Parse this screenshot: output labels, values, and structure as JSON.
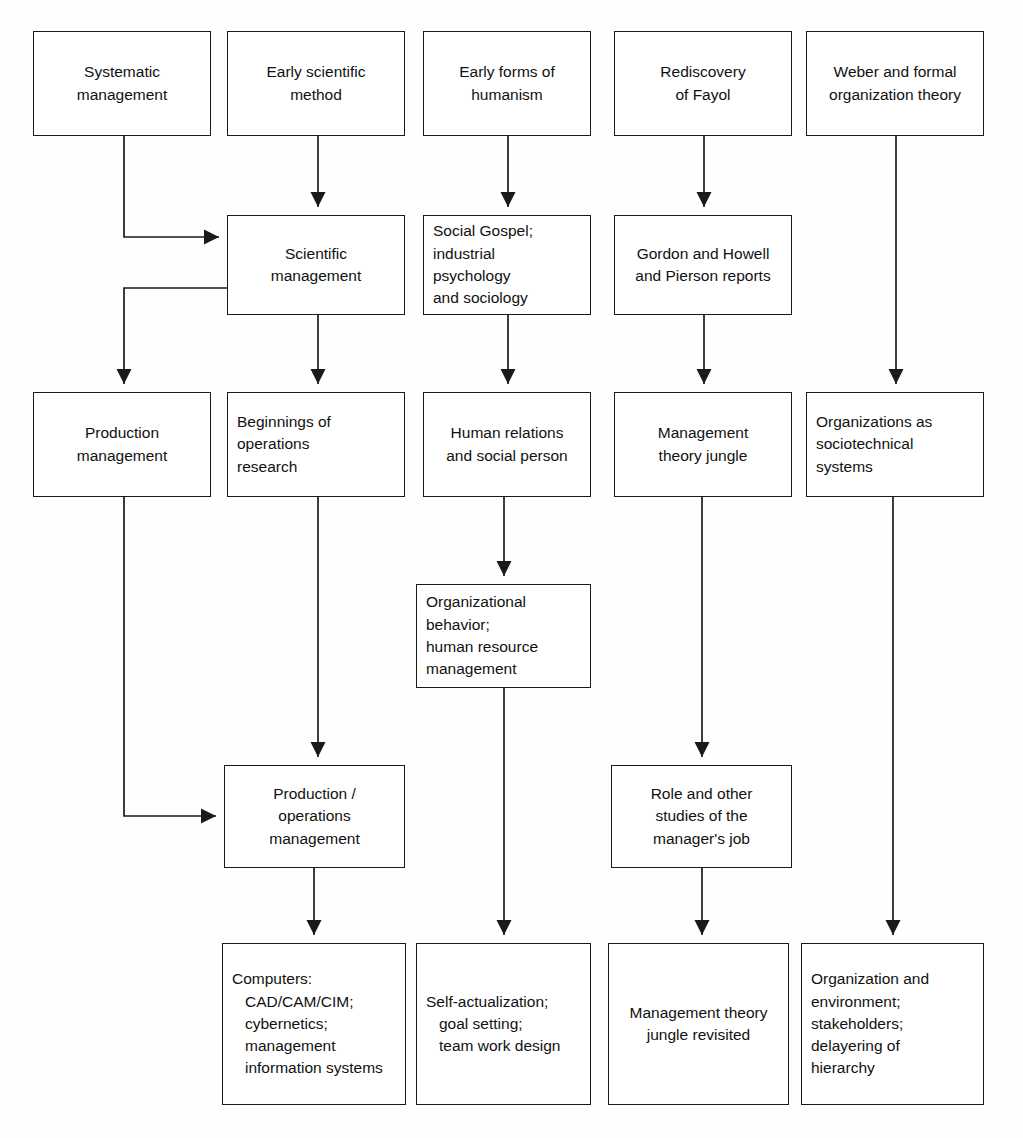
{
  "diagram": {
    "type": "flowchart",
    "background_color": "#fefefe",
    "line_color": "#1a1a1a",
    "text_color": "#111111",
    "nodes": [
      {
        "id": "systematic_management",
        "text": "Systematic\nmanagement",
        "align": "center",
        "x": 33,
        "y": 31,
        "w": 178,
        "h": 105
      },
      {
        "id": "early_scientific_method",
        "text": "Early scientific\nmethod",
        "align": "center",
        "x": 227,
        "y": 31,
        "w": 178,
        "h": 105
      },
      {
        "id": "early_forms_humanism",
        "text": "Early forms of\nhumanism",
        "align": "center",
        "x": 423,
        "y": 31,
        "w": 168,
        "h": 105
      },
      {
        "id": "rediscovery_of_fayol",
        "text": "Rediscovery\nof Fayol",
        "align": "center",
        "x": 614,
        "y": 31,
        "w": 178,
        "h": 105
      },
      {
        "id": "weber_formal_org",
        "text": "Weber and formal\norganization theory",
        "align": "center",
        "x": 806,
        "y": 31,
        "w": 178,
        "h": 105
      },
      {
        "id": "scientific_management",
        "text": "Scientific\nmanagement",
        "align": "center",
        "x": 227,
        "y": 215,
        "w": 178,
        "h": 100
      },
      {
        "id": "social_gospel",
        "text": "Social Gospel;\nindustrial\npsychology\nand sociology",
        "align": "left",
        "x": 423,
        "y": 215,
        "w": 168,
        "h": 100
      },
      {
        "id": "gordon_howell_pierson",
        "text": "Gordon and Howell\nand Pierson reports",
        "align": "center",
        "x": 614,
        "y": 215,
        "w": 178,
        "h": 100
      },
      {
        "id": "production_management",
        "text": "Production\nmanagement",
        "align": "center",
        "x": 33,
        "y": 392,
        "w": 178,
        "h": 105
      },
      {
        "id": "beginnings_op_research",
        "text": "Beginnings of\noperations\nresearch",
        "align": "left",
        "x": 227,
        "y": 392,
        "w": 178,
        "h": 105
      },
      {
        "id": "human_relations",
        "text": "Human relations\nand social person",
        "align": "center",
        "x": 423,
        "y": 392,
        "w": 168,
        "h": 105
      },
      {
        "id": "management_theory_jungle",
        "text": "Management\ntheory jungle",
        "align": "center",
        "x": 614,
        "y": 392,
        "w": 178,
        "h": 105
      },
      {
        "id": "orgs_sociotechnical",
        "text": "Organizations as\nsociotechnical\nsystems",
        "align": "left",
        "x": 806,
        "y": 392,
        "w": 178,
        "h": 105
      },
      {
        "id": "organizational_behavior",
        "text": "Organizational\nbehavior;\nhuman resource\nmanagement",
        "align": "left",
        "x": 416,
        "y": 584,
        "w": 175,
        "h": 104
      },
      {
        "id": "production_operations",
        "text": "Production /\noperations\nmanagement",
        "align": "center",
        "x": 224,
        "y": 765,
        "w": 181,
        "h": 103
      },
      {
        "id": "role_studies_manager",
        "text": "Role and other\nstudies of the\nmanager's job",
        "align": "center",
        "x": 611,
        "y": 765,
        "w": 181,
        "h": 103
      },
      {
        "id": "computers_cad_cam",
        "text": "Computers:\n CAD/CAM/CIM;\n cybernetics;\n management\n information systems",
        "align": "hang",
        "x": 222,
        "y": 943,
        "w": 184,
        "h": 162
      },
      {
        "id": "self_actualization",
        "text": "Self-actualization;\n goal setting;\n team work design",
        "align": "hang",
        "x": 416,
        "y": 943,
        "w": 175,
        "h": 162
      },
      {
        "id": "mgmt_theory_revisited",
        "text": "Management theory\njungle revisited",
        "align": "center",
        "x": 608,
        "y": 943,
        "w": 181,
        "h": 162
      },
      {
        "id": "org_and_environment",
        "text": "Organization and\nenvironment;\nstakeholders;\ndelayering of\nhierarchy",
        "align": "left",
        "x": 801,
        "y": 943,
        "w": 183,
        "h": 162
      }
    ],
    "connectors": [
      {
        "id": "systematic-to-scientific",
        "from": "systematic_management",
        "to": "scientific_management",
        "path": "M 124,136 L 124,237 L 219,237",
        "arrow": "right",
        "tip": [
          219,
          237
        ]
      },
      {
        "id": "early-method-to-scientific",
        "from": "early_scientific_method",
        "to": "scientific_management",
        "path": "M 318,136 L 318,207",
        "arrow": "down",
        "tip": [
          318,
          207
        ]
      },
      {
        "id": "humanism-to-social-gospel",
        "from": "early_forms_humanism",
        "to": "social_gospel",
        "path": "M 508,136 L 508,207",
        "arrow": "down",
        "tip": [
          508,
          207
        ]
      },
      {
        "id": "fayol-to-gordon-howell",
        "from": "rediscovery_of_fayol",
        "to": "gordon_howell_pierson",
        "path": "M 704,136 L 704,207",
        "arrow": "down",
        "tip": [
          704,
          207
        ]
      },
      {
        "id": "weber-to-sociotechnical",
        "from": "weber_formal_org",
        "to": "orgs_sociotechnical",
        "path": "M 896,136 L 896,384",
        "arrow": "down",
        "tip": [
          896,
          384
        ]
      },
      {
        "id": "scientific-to-production",
        "from": "scientific_management",
        "to": "production_management",
        "path": "M 227,288 L 124,288 L 124,384",
        "arrow": "down",
        "tip": [
          124,
          384
        ]
      },
      {
        "id": "scientific-to-beginnings-or",
        "from": "scientific_management",
        "to": "beginnings_op_research",
        "path": "M 318,315 L 318,384",
        "arrow": "down",
        "tip": [
          318,
          384
        ]
      },
      {
        "id": "social-gospel-to-human-rel",
        "from": "social_gospel",
        "to": "human_relations",
        "path": "M 508,315 L 508,384",
        "arrow": "down",
        "tip": [
          508,
          384
        ]
      },
      {
        "id": "gordon-to-theory-jungle",
        "from": "gordon_howell_pierson",
        "to": "management_theory_jungle",
        "path": "M 704,315 L 704,384",
        "arrow": "down",
        "tip": [
          704,
          384
        ]
      },
      {
        "id": "production-to-prod-operations",
        "from": "production_management",
        "to": "production_operations",
        "path": "M 124,497 L 124,816 L 216,816",
        "arrow": "right",
        "tip": [
          216,
          816
        ]
      },
      {
        "id": "beginnings-to-prod-operations",
        "from": "beginnings_op_research",
        "to": "production_operations",
        "path": "M 318,497 L 318,757",
        "arrow": "down",
        "tip": [
          318,
          757
        ]
      },
      {
        "id": "human-rel-to-org-behavior",
        "from": "human_relations",
        "to": "organizational_behavior",
        "path": "M 504,497 L 504,576",
        "arrow": "down",
        "tip": [
          504,
          576
        ]
      },
      {
        "id": "theory-jungle-to-role-studies",
        "from": "management_theory_jungle",
        "to": "role_studies_manager",
        "path": "M 702,497 L 702,757",
        "arrow": "down",
        "tip": [
          702,
          757
        ]
      },
      {
        "id": "sociotechnical-to-org-env",
        "from": "orgs_sociotechnical",
        "to": "org_and_environment",
        "path": "M 893,497 L 893,935",
        "arrow": "down",
        "tip": [
          893,
          935
        ]
      },
      {
        "id": "prod-operations-to-computers",
        "from": "production_operations",
        "to": "computers_cad_cam",
        "path": "M 314,868 L 314,935",
        "arrow": "down",
        "tip": [
          314,
          935
        ]
      },
      {
        "id": "org-behavior-to-self-actual",
        "from": "organizational_behavior",
        "to": "self_actualization",
        "path": "M 504,688 L 504,935",
        "arrow": "down",
        "tip": [
          504,
          935
        ]
      },
      {
        "id": "role-studies-to-jungle-revisit",
        "from": "role_studies_manager",
        "to": "mgmt_theory_revisited",
        "path": "M 702,868 L 702,935",
        "arrow": "down",
        "tip": [
          702,
          935
        ]
      }
    ]
  }
}
